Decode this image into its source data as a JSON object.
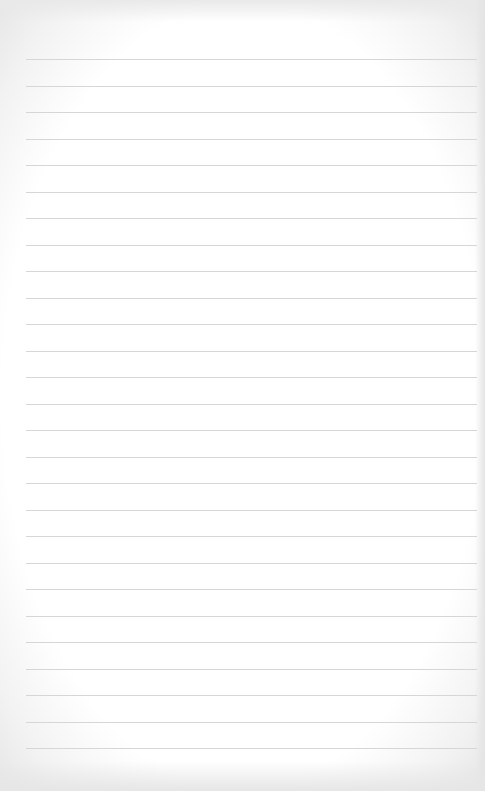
{
  "page": {
    "type": "blank lined paper",
    "background_color": "#ffffff",
    "line_color": "#d6d6d6"
  },
  "rules": {
    "count": 27,
    "first_y": 59,
    "spacing": 26.5,
    "left": 26,
    "right": 477
  }
}
